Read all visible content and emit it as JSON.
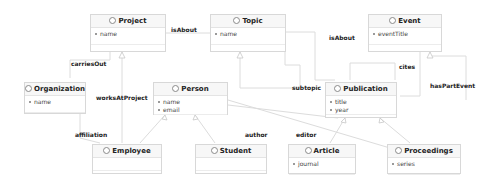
{
  "classes": {
    "project": {
      "name": "Project",
      "attrs": [
        "name"
      ]
    },
    "topic": {
      "name": "Topic",
      "attrs": [
        "name"
      ]
    },
    "event": {
      "name": "Event",
      "attrs": [
        "eventTitle"
      ]
    },
    "organization": {
      "name": "Organization",
      "attrs": [
        "name"
      ]
    },
    "person": {
      "name": "Person",
      "attrs": [
        "name",
        "email"
      ]
    },
    "publication": {
      "name": "Publication",
      "attrs": [
        "title",
        "year"
      ]
    },
    "employee": {
      "name": "Employee",
      "attrs": []
    },
    "student": {
      "name": "Student",
      "attrs": []
    },
    "article": {
      "name": "Article",
      "attrs": [
        "journal"
      ]
    },
    "proceedings": {
      "name": "Proceedings",
      "attrs": [
        "series"
      ]
    }
  },
  "associations": {
    "isAbout_project_topic": "isAbout",
    "isAbout_publication_topic": "isAbout",
    "carriesOut": "carriesOut",
    "worksAtProject": "worksAtProject",
    "affiliation": "affiliation",
    "subtopic": "subtopic",
    "cites": "cites",
    "hasPartEvent": "hasPartEvent",
    "author": "author",
    "editor": "editor"
  },
  "colors": {
    "box_border": "#d8d8d8",
    "line": "#dcdcdc",
    "header_bg": "#f7f7f7"
  }
}
